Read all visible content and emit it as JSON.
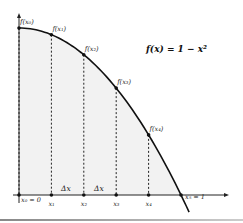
{
  "diagram": {
    "title": "f(x) = 1 − x²",
    "function": "1 - x^2",
    "colors": {
      "curve": "#111111",
      "axis": "#222222",
      "shading": "#f2f2f2",
      "dashed": "#222222"
    },
    "points": [
      {
        "x": 0.0,
        "y": 1.0,
        "f_label": "f(x₀)",
        "x_label": "x₀ = 0"
      },
      {
        "x": 0.2,
        "y": 0.96,
        "f_label": "f(x₁)",
        "x_label": "x₁"
      },
      {
        "x": 0.4,
        "y": 0.84,
        "f_label": "f(x₂)",
        "x_label": "x₂"
      },
      {
        "x": 0.6,
        "y": 0.64,
        "f_label": "f(x₃)",
        "x_label": "x₃"
      },
      {
        "x": 0.8,
        "y": 0.36,
        "f_label": "f(x₄)",
        "x_label": "x₄"
      },
      {
        "x": 1.0,
        "y": 0.0,
        "f_label": "",
        "x_label": "x₅ = 1"
      }
    ],
    "delta_labels": [
      "Δx",
      "Δx"
    ]
  }
}
